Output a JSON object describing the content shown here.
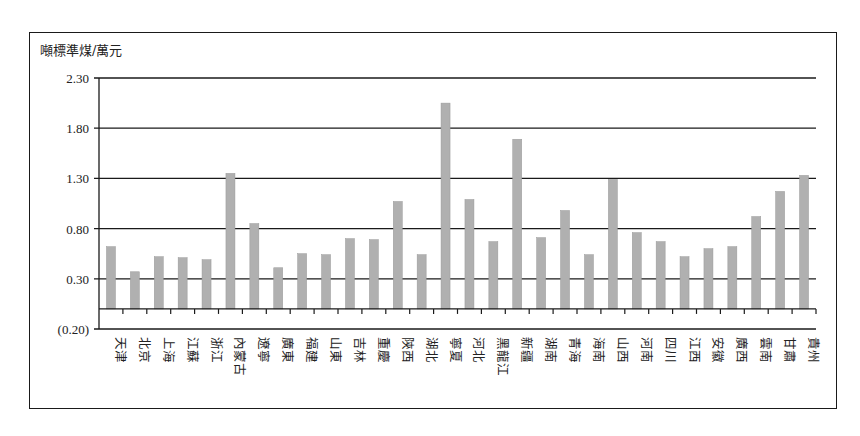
{
  "chart_data": {
    "type": "bar",
    "title": "",
    "ylabel": "噸標準煤/萬元",
    "xlabel": "",
    "ylim": [
      -0.2,
      2.3
    ],
    "yticks": [
      2.3,
      1.8,
      1.3,
      0.8,
      0.3,
      -0.2
    ],
    "ytick_labels": [
      "2.30",
      "1.80",
      "1.30",
      "0.80",
      "0.30",
      "(0.20)"
    ],
    "grid": true,
    "legend": null,
    "bar_color": "#b0b0b0",
    "categories": [
      "天津",
      "北京",
      "上海",
      "江蘇",
      "浙江",
      "內蒙古",
      "遼寧",
      "廣東",
      "福建",
      "山東",
      "吉林",
      "重慶",
      "陝西",
      "湖北",
      "寧夏",
      "河北",
      "黑龍江",
      "新疆",
      "湖南",
      "青海",
      "海南",
      "山西",
      "河南",
      "四川",
      "江西",
      "安徽",
      "廣西",
      "雲南",
      "甘肅",
      "貴州"
    ],
    "values": [
      0.62,
      0.37,
      0.52,
      0.51,
      0.49,
      1.35,
      0.85,
      0.41,
      0.55,
      0.54,
      0.7,
      0.69,
      1.07,
      0.54,
      2.05,
      1.09,
      0.67,
      1.69,
      0.71,
      0.98,
      0.54,
      1.29,
      0.76,
      0.67,
      0.52,
      0.6,
      0.62,
      0.92,
      1.17,
      1.33
    ]
  }
}
